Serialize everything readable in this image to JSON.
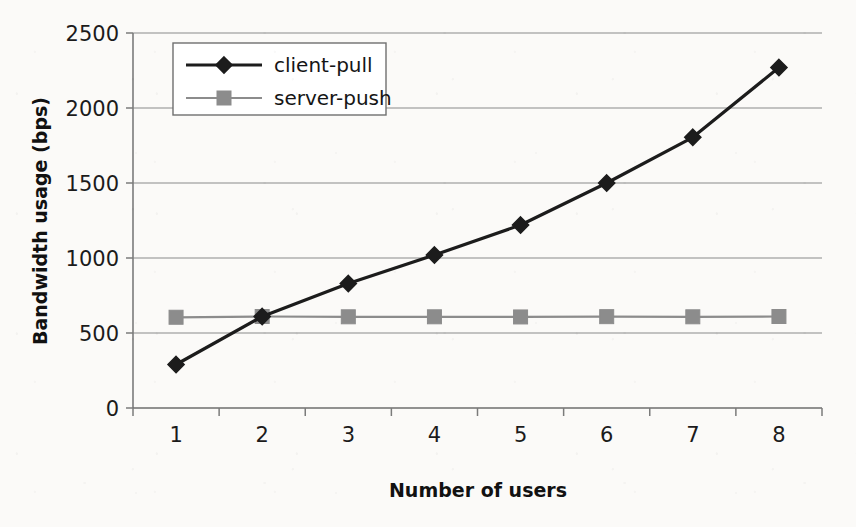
{
  "chart_data": {
    "type": "line",
    "title": "",
    "xlabel": "Number of users",
    "ylabel": "Bandwidth usage (bps)",
    "categories": [
      "1",
      "2",
      "3",
      "4",
      "5",
      "6",
      "7",
      "8"
    ],
    "ytick_labels": [
      "0",
      "500",
      "1000",
      "1500",
      "2000",
      "2500"
    ],
    "yticks": [
      0,
      500,
      1000,
      1500,
      2000,
      2500
    ],
    "ylim": [
      0,
      2500
    ],
    "grid": "horizontal",
    "legend_position": "top-left-inside",
    "series": [
      {
        "name": "client-pull",
        "marker": "diamond",
        "color": "#1c1c1c",
        "line_color": "#1c1c1c",
        "values": [
          290,
          610,
          830,
          1020,
          1220,
          1500,
          1805,
          2270
        ]
      },
      {
        "name": "server-push",
        "marker": "square",
        "color": "#8c8c8c",
        "line_color": "#8c8c8c",
        "values": [
          605,
          610,
          608,
          608,
          607,
          609,
          608,
          610
        ]
      }
    ]
  },
  "axes": {
    "y_axis_title": "Bandwidth usage (bps)",
    "x_axis_title": "Number of users"
  },
  "legend": {
    "entries": [
      {
        "label": "client-pull",
        "marker_icon": "diamond-marker-icon"
      },
      {
        "label": "server-push",
        "marker_icon": "square-marker-icon"
      }
    ]
  },
  "style": {
    "background": "#fbfaf8",
    "axis_color": "#7b7b7b",
    "grid_color": "#8a8a8a",
    "client_pull_color": "#1c1c1c",
    "server_push_color": "#8c8c8c",
    "legend_border": "#6f6f6f"
  }
}
